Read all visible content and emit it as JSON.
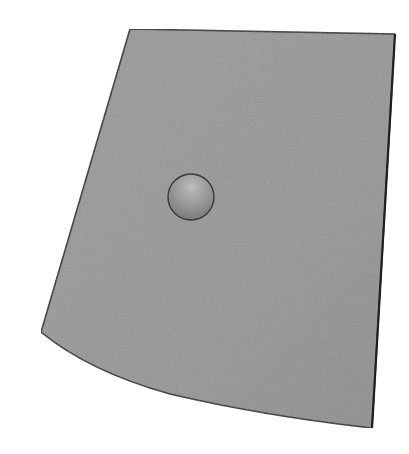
{
  "scene": {
    "description": "3D render of a curved gray sheet with a small sphere resting on it",
    "background_color": "#ffffff",
    "sheet": {
      "label": "curved-sheet",
      "fill_color": "#969696",
      "edge_color": "#2e2e2e",
      "corners": {
        "top_left": [
          130,
          29
        ],
        "top_right": [
          395,
          34
        ],
        "bottom_right": [
          372,
          428
        ],
        "bottom_left": [
          41,
          332
        ]
      }
    },
    "sphere": {
      "label": "sphere",
      "center": [
        191,
        197
      ],
      "radius": 23,
      "base_color": "#8a8a8a",
      "highlight_color": "#b8b8b8",
      "outline_color": "#3a3a3a"
    }
  }
}
